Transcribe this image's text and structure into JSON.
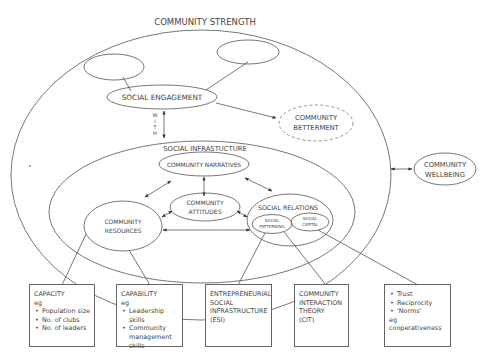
{
  "diagram": {
    "outer_title": "COMMUNITY STRENGTH",
    "social_engagement": "SOCIAL ENGAGEMENT",
    "with_label": [
      "W",
      "I",
      "T",
      "H"
    ],
    "community_betterment": [
      "COMMUNITY",
      "BETTERMENT"
    ],
    "community_wellbeing": [
      "COMMUNITY",
      "WELLBEING"
    ],
    "social_infrastructure": "SOCIAL INFRASTUCTURE",
    "community_narratives": "COMMUNITY NARRATIVES",
    "community_attitudes": [
      "COMMUNITY",
      "ATTITUDES"
    ],
    "community_resources": [
      "COMMUNITY",
      "RESOURCES"
    ],
    "social_relations": "SOCIAL RELATIONS",
    "social_patterning": [
      "SOCIAL",
      "PATTERNING"
    ],
    "social_capital": [
      "SOCIAL",
      "CAPITAL"
    ]
  },
  "boxes": [
    {
      "title": "CAPACITY",
      "sub": "eg",
      "bullets": [
        "Population size",
        "No. of clubs",
        "No. of leaders"
      ],
      "extra": []
    },
    {
      "title": "CAPABILITY",
      "sub": "eg",
      "bullets": [
        "Leadership skills",
        "Community management skills"
      ],
      "extra": []
    },
    {
      "title": "ENTREPRENEURIAL SOCIAL INFRASTRUCTURE (ESI)",
      "lines": [
        "ENTREPRENEURIAL",
        "SOCIAL",
        "INFRASTRUCTURE",
        "(ESI)"
      ]
    },
    {
      "title": "COMMUNITY INTERACTION THEORY (CIT)",
      "lines": [
        "COMMUNITY",
        "INTERACTION",
        "THEORY",
        "(CIT)"
      ]
    },
    {
      "bullets": [
        "Trust",
        "Reciprocity",
        "'Norms'"
      ],
      "extra": [
        "eg",
        "cooperativeness"
      ]
    }
  ]
}
